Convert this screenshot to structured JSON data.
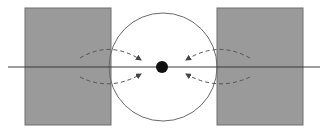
{
  "diagram": {
    "title": "",
    "colors": {
      "background": "#ffffff",
      "block_fill": "#9a9a9a",
      "block_stroke": "#6e6e6e",
      "circle_stroke": "#6a6a6a",
      "axis_line": "#3a3a3a",
      "dashed_arrow": "#555555",
      "center_dot": "#111111"
    },
    "elements": {
      "left_block": {
        "x": 25,
        "y": 8,
        "width": 86,
        "height": 117
      },
      "right_block": {
        "x": 217,
        "y": 8,
        "width": 86,
        "height": 117
      },
      "circle": {
        "cx": 163,
        "cy": 67,
        "r": 54
      },
      "axis": {
        "x1": 8,
        "x2": 320,
        "y": 67
      },
      "center_dot": {
        "cx": 162,
        "cy": 67,
        "r": 6
      },
      "arrows": [
        {
          "id": "left-upper",
          "d": "M 80 58 Q 110 40 141 60"
        },
        {
          "id": "left-lower",
          "d": "M 80 77 Q 110 92 141 74"
        },
        {
          "id": "right-upper",
          "d": "M 250 58 Q 218 40 186 60"
        },
        {
          "id": "right-lower",
          "d": "M 250 77 Q 218 92 186 74"
        }
      ]
    },
    "labels": []
  }
}
